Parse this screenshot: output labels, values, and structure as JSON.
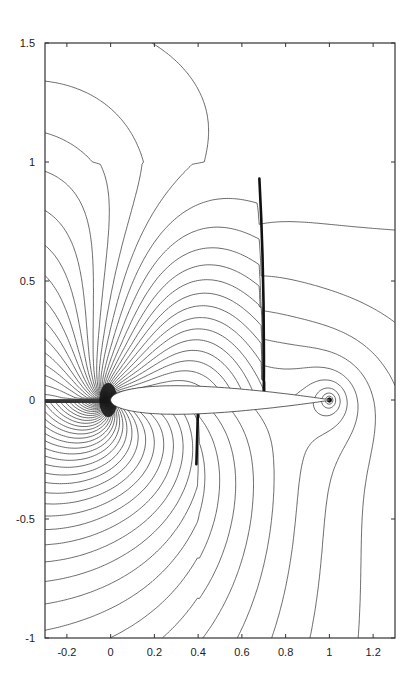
{
  "chart_data": {
    "type": "contour",
    "title": "",
    "xlabel": "",
    "ylabel": "",
    "xlim": [
      -0.3,
      1.3
    ],
    "ylim": [
      -1,
      1.5
    ],
    "grid": false,
    "legend": null,
    "x_ticks": [
      -0.2,
      0,
      0.2,
      0.4,
      0.6,
      0.8,
      1,
      1.2
    ],
    "x_tick_labels": [
      "-0.2",
      "0",
      "0.2",
      "0.4",
      "0.6",
      "0.8",
      "1",
      "1.2"
    ],
    "y_ticks": [
      -1,
      -0.5,
      0,
      0.5,
      1,
      1.5
    ],
    "y_tick_labels": [
      "-1",
      "-0.5",
      "0",
      "0.5",
      "1",
      "1.5"
    ],
    "airfoil": {
      "leading_edge": [
        0,
        0
      ],
      "trailing_edge": [
        1,
        0
      ],
      "max_thickness": 0.12
    },
    "features": [
      {
        "name": "upper-shock",
        "x_at_surface": 0.7,
        "y_range": [
          0.03,
          0.93
        ],
        "x_at_top": 0.68
      },
      {
        "name": "lower-shock",
        "x_at_surface": 0.4,
        "y_range": [
          -0.27,
          -0.02
        ]
      },
      {
        "name": "leading-edge-stagnation-cluster",
        "center": [
          -0.02,
          0
        ]
      },
      {
        "name": "trailing-edge-singularity",
        "center": [
          1.0,
          0
        ]
      }
    ],
    "contour_color": "#3a3a3a",
    "background": "#ffffff"
  }
}
